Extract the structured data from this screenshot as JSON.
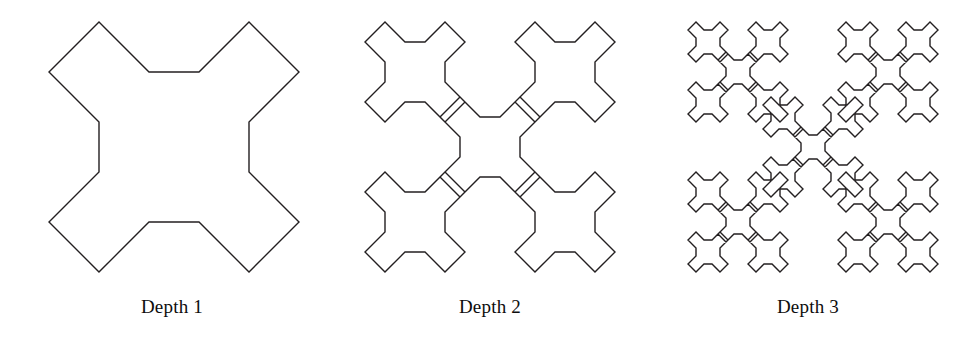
{
  "figure": {
    "background_color": "#ffffff",
    "stroke_color": "#231f20",
    "panels": [
      {
        "caption": "Depth 1",
        "depth": 1,
        "art_name": "cross-fractal-depth-1"
      },
      {
        "caption": "Depth 2",
        "depth": 2,
        "art_name": "cross-fractal-depth-2"
      },
      {
        "caption": "Depth 3",
        "depth": 3,
        "art_name": "cross-fractal-depth-3"
      }
    ]
  },
  "chart_data": {
    "type": "line",
    "title": "",
    "xlabel": "",
    "ylabel": "",
    "generator": {
      "name": "cross-outline",
      "comment": "Closed outline of the depth-1 cross in unit-square coordinates; 16 vertices on a 0.2 grid, traversed clockwise.",
      "vertices": [
        [
          0.0,
          0.2
        ],
        [
          0.2,
          0.0
        ],
        [
          0.4,
          0.2
        ],
        [
          0.6,
          0.2
        ],
        [
          0.8,
          0.0
        ],
        [
          1.0,
          0.2
        ],
        [
          0.8,
          0.4
        ],
        [
          0.8,
          0.6
        ],
        [
          1.0,
          0.8
        ],
        [
          0.8,
          1.0
        ],
        [
          0.6,
          0.8
        ],
        [
          0.4,
          0.8
        ],
        [
          0.2,
          1.0
        ],
        [
          0.0,
          0.8
        ],
        [
          0.2,
          0.6
        ],
        [
          0.2,
          0.4
        ]
      ]
    },
    "recursion": {
      "child_scale": 0.4,
      "child_offsets": [
        [
          0.0,
          0.0
        ],
        [
          0.6,
          0.0
        ],
        [
          0.3,
          0.3
        ],
        [
          0.0,
          0.6
        ],
        [
          0.6,
          0.6
        ]
      ],
      "copies_per_level": 5,
      "shapes_at_depth": [
        1,
        5,
        25
      ]
    },
    "view": {
      "size": 258,
      "pad": 4,
      "stroke_width": 1.4
    },
    "series": [
      {
        "name": "Depth 1",
        "depth": 1,
        "shape_count": 1
      },
      {
        "name": "Depth 2",
        "depth": 2,
        "shape_count": 5
      },
      {
        "name": "Depth 3",
        "depth": 3,
        "shape_count": 25
      }
    ]
  }
}
